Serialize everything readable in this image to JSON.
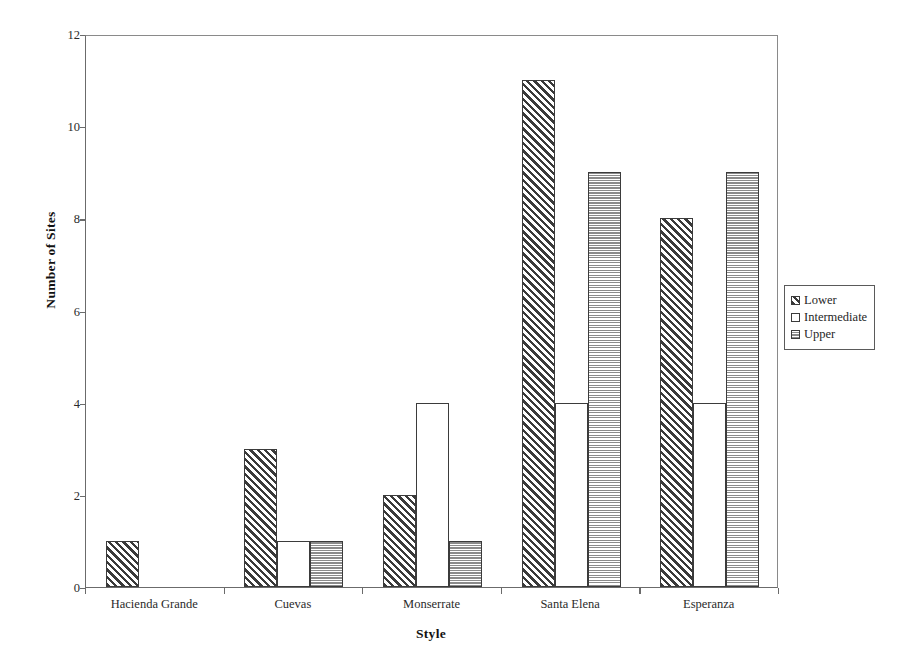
{
  "chart_data": {
    "type": "bar",
    "title": "",
    "xlabel": "Style",
    "ylabel": "Number of Sites",
    "categories": [
      "Hacienda Grande",
      "Cuevas",
      "Monserrate",
      "Santa Elena",
      "Esperanza"
    ],
    "series": [
      {
        "name": "Lower",
        "values": [
          1,
          3,
          2,
          11,
          8
        ],
        "pattern": "diagonal-hatch"
      },
      {
        "name": "Intermediate",
        "values": [
          0,
          1,
          4,
          4,
          4
        ],
        "pattern": "sparse-speckle"
      },
      {
        "name": "Upper",
        "values": [
          0,
          1,
          1,
          9,
          9
        ],
        "pattern": "dense-dot-grid"
      }
    ],
    "ylim": [
      0,
      12
    ],
    "yticks": [
      0,
      2,
      4,
      6,
      8,
      10,
      12
    ],
    "ytick_labels": [
      "0",
      "2",
      "4",
      "6",
      "8",
      "10",
      "12"
    ],
    "grid": false,
    "legend_position": "right",
    "colors": {
      "axis": "#6b6b6b",
      "bar_outline": "#3b3b3b",
      "text": "#1a1a1a",
      "background": "#ffffff"
    }
  }
}
